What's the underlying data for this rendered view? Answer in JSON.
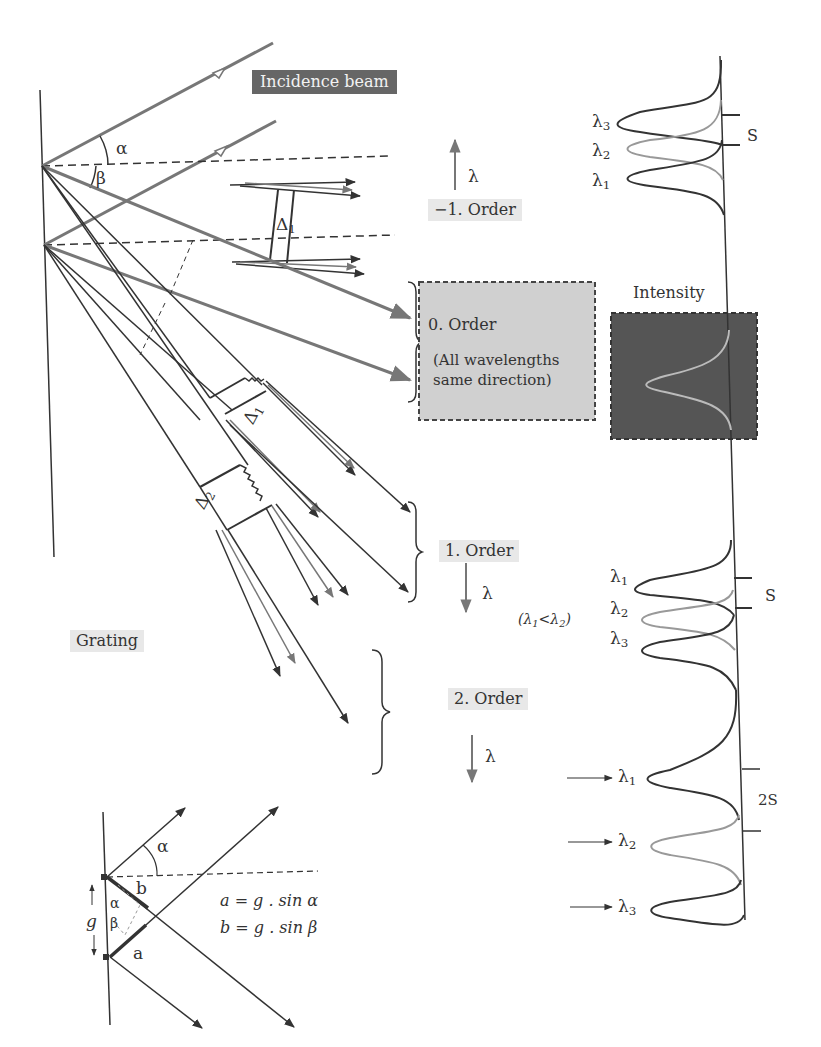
{
  "labels": {
    "incidence_beam": "Incidence beam",
    "order_minus1": "−1. Order",
    "order_0": "0. Order",
    "order_0_note": "(All wavelengths same direction)",
    "order_1": "1. Order",
    "order_2": "2. Order",
    "intensity": "Intensity",
    "grating": "Grating",
    "lambda": "λ",
    "lambda_relation": "(λ1<λ2)",
    "alpha": "α",
    "beta": "β",
    "delta1": "Δ",
    "delta2": "Δ",
    "s_top": "S",
    "s_mid": "S",
    "s_2": "2S",
    "g": "g",
    "a": "a",
    "b": "b",
    "eq_a": "a = g . sin α",
    "eq_b": "b = g . sin β"
  },
  "spectra": {
    "minus1": [
      "λ3",
      "λ2",
      "λ1"
    ],
    "first": [
      "λ1",
      "λ2",
      "λ3"
    ],
    "second": [
      "λ1",
      "λ2",
      "λ3"
    ]
  },
  "colors": {
    "line": "#333333",
    "grey_line": "#777777",
    "light_curve": "#999999",
    "dark_box": "#555555",
    "grey_box": "#d0d0d0"
  }
}
